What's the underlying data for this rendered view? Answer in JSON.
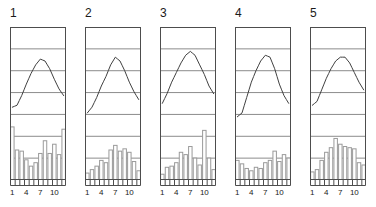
{
  "figure": {
    "type": "small-multiples-climograph",
    "panel_count": 5,
    "width": 376,
    "height": 207,
    "background_color": "#ffffff",
    "frame_color": "#4d4d4d",
    "gridline_color": "#8c8c8c",
    "curve_color": "#404040",
    "bar_color": "#9a9a9a",
    "bar_fill": "#ffffff",
    "text_color": "#1a1a1a"
  },
  "axis": {
    "tick_count": 12,
    "tick_labels": [
      "1",
      "4",
      "7",
      "10"
    ],
    "tick_label_positions": [
      1,
      4,
      7,
      10
    ],
    "xlabel": "",
    "ylabel": ""
  },
  "panels": [
    {
      "title": "1",
      "x": 8,
      "chart_data": {
        "type": "line",
        "title": "1",
        "xlabel": "",
        "ylabel": "",
        "grid": true,
        "gridline_count": 7,
        "categories": [
          "1",
          "2",
          "3",
          "4",
          "5",
          "6",
          "7",
          "8",
          "9",
          "10",
          "11",
          "12"
        ],
        "series": [
          {
            "name": "temperature",
            "type": "line",
            "values": [
              28,
              30,
              40,
              52,
              63,
              72,
              78,
              76,
              68,
              57,
              47,
              40
            ],
            "ylim": [
              0,
              100
            ]
          },
          {
            "name": "precipitation",
            "type": "bar",
            "values": [
              92,
              52,
              50,
              35,
              24,
              30,
              46,
              68,
              46,
              62,
              44,
              88
            ],
            "ylim": [
              0,
              100
            ]
          }
        ]
      }
    },
    {
      "title": "2",
      "x": 83,
      "chart_data": {
        "type": "line",
        "title": "2",
        "xlabel": "",
        "ylabel": "",
        "grid": true,
        "gridline_count": 7,
        "categories": [
          "1",
          "2",
          "3",
          "4",
          "5",
          "6",
          "7",
          "8",
          "9",
          "10",
          "11",
          "12"
        ],
        "series": [
          {
            "name": "temperature",
            "type": "line",
            "values": [
              22,
              28,
              38,
              50,
              60,
              72,
              80,
              76,
              66,
              54,
              44,
              36
            ],
            "ylim": [
              0,
              100
            ]
          },
          {
            "name": "precipitation",
            "type": "bar",
            "values": [
              12,
              18,
              24,
              34,
              30,
              52,
              60,
              50,
              54,
              48,
              32,
              16
            ],
            "ylim": [
              0,
              100
            ]
          }
        ]
      }
    },
    {
      "title": "3",
      "x": 158,
      "chart_data": {
        "type": "line",
        "title": "3",
        "xlabel": "",
        "ylabel": "",
        "grid": true,
        "gridline_count": 7,
        "categories": [
          "1",
          "2",
          "3",
          "4",
          "5",
          "6",
          "7",
          "8",
          "9",
          "10",
          "11",
          "12"
        ],
        "series": [
          {
            "name": "temperature",
            "type": "line",
            "values": [
              32,
              42,
              54,
              64,
              74,
              82,
              86,
              82,
              72,
              62,
              50,
              42
            ],
            "ylim": [
              0,
              100
            ]
          },
          {
            "name": "precipitation",
            "type": "bar",
            "values": [
              10,
              22,
              24,
              30,
              48,
              44,
              58,
              38,
              26,
              86,
              38,
              18
            ],
            "ylim": [
              0,
              100
            ]
          }
        ]
      }
    },
    {
      "title": "4",
      "x": 233,
      "chart_data": {
        "type": "line",
        "title": "4",
        "xlabel": "",
        "ylabel": "",
        "grid": true,
        "gridline_count": 7,
        "categories": [
          "1",
          "2",
          "3",
          "4",
          "5",
          "6",
          "7",
          "8",
          "9",
          "10",
          "11",
          "12"
        ],
        "series": [
          {
            "name": "temperature",
            "type": "line",
            "values": [
              18,
              22,
              38,
              54,
              66,
              76,
              82,
              80,
              68,
              52,
              40,
              32
            ],
            "ylim": [
              0,
              100
            ]
          },
          {
            "name": "precipitation",
            "type": "bar",
            "values": [
              34,
              28,
              20,
              16,
              22,
              20,
              30,
              34,
              50,
              32,
              44,
              38
            ],
            "ylim": [
              0,
              100
            ]
          }
        ]
      }
    },
    {
      "title": "5",
      "x": 308,
      "chart_data": {
        "type": "line",
        "title": "5",
        "xlabel": "",
        "ylabel": "",
        "grid": true,
        "gridline_count": 7,
        "categories": [
          "1",
          "2",
          "3",
          "4",
          "5",
          "6",
          "7",
          "8",
          "9",
          "10",
          "11",
          "12"
        ],
        "series": [
          {
            "name": "temperature",
            "type": "line",
            "values": [
              30,
              34,
              46,
              58,
              68,
              76,
              80,
              80,
              74,
              64,
              54,
              46
            ],
            "ylim": [
              0,
              100
            ]
          },
          {
            "name": "precipitation",
            "type": "bar",
            "values": [
              14,
              18,
              34,
              48,
              56,
              72,
              62,
              58,
              56,
              54,
              30,
              26
            ],
            "ylim": [
              0,
              100
            ]
          }
        ]
      }
    }
  ]
}
